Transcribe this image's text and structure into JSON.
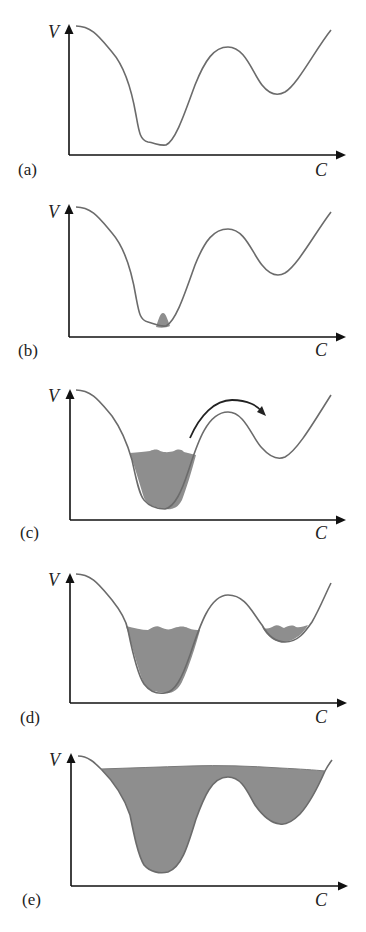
{
  "figure": {
    "axis_labels": {
      "y": "V",
      "x": "C"
    },
    "colors": {
      "curve": "#6b6b6b",
      "axis": "#111111",
      "fill": "#8e8e8e",
      "arrow": "#222222"
    },
    "panels": [
      {
        "id": "a",
        "label": "(a)",
        "state": "empty landscape"
      },
      {
        "id": "b",
        "label": "(b)",
        "state": "small amount at bottom of deepest well"
      },
      {
        "id": "c",
        "label": "(c)",
        "state": "deep well partly filled, arrow indicating escape over barrier"
      },
      {
        "id": "d",
        "label": "(d)",
        "state": "both wells partly filled"
      },
      {
        "id": "e",
        "label": "(e)",
        "state": "landscape filled above barrier"
      }
    ]
  }
}
